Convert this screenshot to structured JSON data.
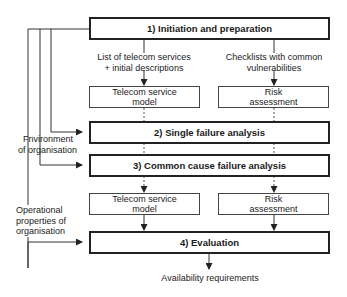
{
  "diagram": {
    "steps": [
      {
        "id": "1",
        "label": "1) Initiation and preparation"
      },
      {
        "id": "2",
        "label": "2) Single failure analysis"
      },
      {
        "id": "3",
        "label": "3) Common cause failure analysis"
      },
      {
        "id": "4",
        "label": "4) Evaluation"
      }
    ],
    "artifacts_top": {
      "telecom": {
        "line1": "Telecom service",
        "line2": "model"
      },
      "risk": {
        "line1": "Risk",
        "line2": "assessment"
      }
    },
    "artifacts_bottom": {
      "telecom": {
        "line1": "Telecom service",
        "line2": "model"
      },
      "risk": {
        "line1": "Risk",
        "line2": "assessment"
      }
    },
    "flow_labels": {
      "telecom_list": {
        "line1": "List of telecom services",
        "line2": "+ initial descriptions"
      },
      "checklists": {
        "line1": "Checklists with common",
        "line2": "vulnerabilities"
      },
      "environment": {
        "line1": "Fnvironment",
        "line2": "of organisation"
      },
      "operational": {
        "line1": "Operational",
        "line2": "properties of",
        "line3": "organisation"
      },
      "output": "Availability requirements"
    },
    "colors": {
      "line": "#222222",
      "background": "#ffffff"
    }
  }
}
